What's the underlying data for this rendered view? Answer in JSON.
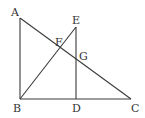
{
  "diagram": {
    "points": {
      "A": {
        "label": "A",
        "x": 20,
        "y": 18
      },
      "B": {
        "label": "B",
        "x": 20,
        "y": 99
      },
      "C": {
        "label": "C",
        "x": 131,
        "y": 99
      },
      "D": {
        "label": "D",
        "x": 76,
        "y": 99
      },
      "E": {
        "label": "E",
        "x": 76,
        "y": 27
      },
      "F": {
        "label": "F",
        "x": 60,
        "y": 48
      },
      "G": {
        "label": "G",
        "x": 76,
        "y": 58
      }
    },
    "segments": [
      {
        "from": "A",
        "to": "B"
      },
      {
        "from": "B",
        "to": "C"
      },
      {
        "from": "A",
        "to": "C"
      },
      {
        "from": "B",
        "to": "E"
      },
      {
        "from": "E",
        "to": "D"
      }
    ],
    "line_color": "#3a3a3a",
    "label_color": "#333333"
  }
}
